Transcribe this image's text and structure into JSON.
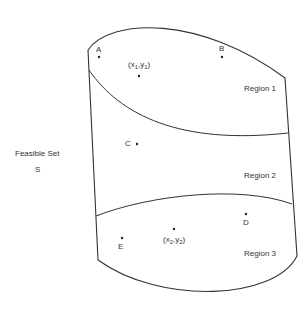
{
  "figure": {
    "set_label": "Feasible Set",
    "set_symbol": "S",
    "regions": [
      {
        "label": "Region 1"
      },
      {
        "label": "Region 2"
      },
      {
        "label": "Region 3"
      }
    ],
    "points": {
      "A": "A",
      "B": "B",
      "C": "C",
      "D": "D",
      "E": "E",
      "p1": {
        "open": "(x",
        "s1": "1",
        "mid": ",y",
        "s2": "1",
        "close": ")"
      },
      "p2": {
        "open": "(x",
        "s1": "2",
        "mid": ",y",
        "s2": "2",
        "close": ")"
      }
    },
    "colors": {
      "stroke": "#333333",
      "background": "#ffffff"
    }
  }
}
